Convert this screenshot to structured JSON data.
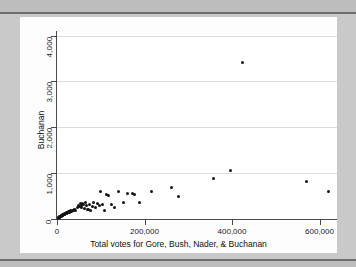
{
  "figure": {
    "background_color": "#c9c9c9",
    "canvas_color": "#fdfdfd",
    "plot_color": "#ffffff",
    "marker_color": "#141414",
    "grid_color": "#dcdcdc",
    "axis_color": "#4a4a4a"
  },
  "chart_data": {
    "type": "scatter",
    "title": "",
    "xlabel": "Total votes for Gore, Bush, Nader, & Buchanan",
    "ylabel": "Buchanan",
    "xlim": [
      0,
      640000
    ],
    "ylim": [
      0,
      4100
    ],
    "xticks": [
      0,
      200000,
      400000,
      600000
    ],
    "xtick_labels": [
      "0",
      "200,000",
      "400,000",
      "600,000"
    ],
    "yticks": [
      0,
      1000,
      2000,
      3000,
      4000
    ],
    "ytick_labels": [
      "0",
      "1,000",
      "2,000",
      "3,000",
      "4,000"
    ],
    "grid": "horizontal",
    "legend": "none",
    "marker": "filled-circle",
    "series": [
      {
        "name": "Florida counties",
        "points": [
          [
            2300,
            20
          ],
          [
            3500,
            25
          ],
          [
            4100,
            30
          ],
          [
            4800,
            35
          ],
          [
            5200,
            40
          ],
          [
            5900,
            45
          ],
          [
            6400,
            50
          ],
          [
            6900,
            55
          ],
          [
            7300,
            48
          ],
          [
            7800,
            60
          ],
          [
            8200,
            65
          ],
          [
            8800,
            58
          ],
          [
            9300,
            70
          ],
          [
            9900,
            75
          ],
          [
            10400,
            62
          ],
          [
            11000,
            80
          ],
          [
            11600,
            72
          ],
          [
            12200,
            85
          ],
          [
            12800,
            90
          ],
          [
            13400,
            78
          ],
          [
            14100,
            95
          ],
          [
            14800,
            88
          ],
          [
            15400,
            100
          ],
          [
            16100,
            92
          ],
          [
            16800,
            110
          ],
          [
            17500,
            105
          ],
          [
            18300,
            118
          ],
          [
            19000,
            112
          ],
          [
            19800,
            125
          ],
          [
            20600,
            120
          ],
          [
            21400,
            132
          ],
          [
            22300,
            128
          ],
          [
            23200,
            140
          ],
          [
            24100,
            135
          ],
          [
            25000,
            148
          ],
          [
            26000,
            155
          ],
          [
            27000,
            145
          ],
          [
            28200,
            160
          ],
          [
            29400,
            152
          ],
          [
            30600,
            168
          ],
          [
            31800,
            175
          ],
          [
            33200,
            165
          ],
          [
            34600,
            182
          ],
          [
            36000,
            190
          ],
          [
            37500,
            178
          ],
          [
            39000,
            200
          ],
          [
            40500,
            210
          ],
          [
            42000,
            195
          ],
          [
            47000,
            240
          ],
          [
            49000,
            300
          ],
          [
            51000,
            270
          ],
          [
            53000,
            330
          ],
          [
            55000,
            290
          ],
          [
            57000,
            250
          ],
          [
            59000,
            345
          ],
          [
            61000,
            310
          ],
          [
            63000,
            225
          ],
          [
            65000,
            360
          ],
          [
            67000,
            285
          ],
          [
            69000,
            200
          ],
          [
            72000,
            215
          ],
          [
            74000,
            320
          ],
          [
            77000,
            180
          ],
          [
            80000,
            265
          ],
          [
            84000,
            350
          ],
          [
            88000,
            240
          ],
          [
            92000,
            330
          ],
          [
            96000,
            300
          ],
          [
            100000,
            600
          ],
          [
            104000,
            320
          ],
          [
            108000,
            180
          ],
          [
            112000,
            530
          ],
          [
            118000,
            520
          ],
          [
            125000,
            310
          ],
          [
            132000,
            240
          ],
          [
            140000,
            600
          ],
          [
            152000,
            350
          ],
          [
            160000,
            560
          ],
          [
            172000,
            550
          ],
          [
            178000,
            530
          ],
          [
            188000,
            350
          ],
          [
            215000,
            600
          ],
          [
            262000,
            690
          ],
          [
            278000,
            480
          ],
          [
            358000,
            880
          ],
          [
            396000,
            1050
          ],
          [
            425000,
            3410
          ],
          [
            570000,
            820
          ],
          [
            620000,
            600
          ]
        ]
      }
    ],
    "annotations": []
  }
}
